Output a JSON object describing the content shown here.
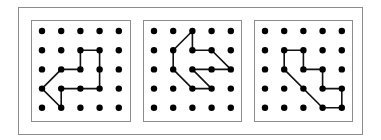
{
  "figure": {
    "colors": {
      "outer_border": "#8c8c8c",
      "panel_border": "#8c8c8c",
      "dot": "#000000",
      "line": "#111111",
      "background": "#ffffff"
    },
    "grid_size": 5,
    "panels": [
      {
        "id": "panel-1",
        "path": [
          [
            2,
            1
          ],
          [
            3,
            1
          ],
          [
            3,
            3
          ],
          [
            1,
            3
          ],
          [
            1,
            4
          ],
          [
            0,
            3
          ],
          [
            1,
            2
          ],
          [
            2,
            2
          ],
          [
            2,
            1
          ]
        ]
      },
      {
        "id": "panel-2",
        "path": [
          [
            2,
            0
          ],
          [
            1,
            1
          ],
          [
            1,
            2
          ],
          [
            2,
            3
          ],
          [
            3,
            3
          ],
          [
            2,
            2
          ],
          [
            4,
            2
          ],
          [
            3,
            1
          ],
          [
            2,
            1
          ],
          [
            2,
            0
          ]
        ]
      },
      {
        "id": "panel-3",
        "path": [
          [
            1,
            1
          ],
          [
            2,
            1
          ],
          [
            2,
            2
          ],
          [
            3,
            2
          ],
          [
            3,
            3
          ],
          [
            4,
            3
          ],
          [
            4,
            4
          ],
          [
            3,
            4
          ],
          [
            1,
            2
          ],
          [
            1,
            1
          ]
        ]
      }
    ]
  }
}
